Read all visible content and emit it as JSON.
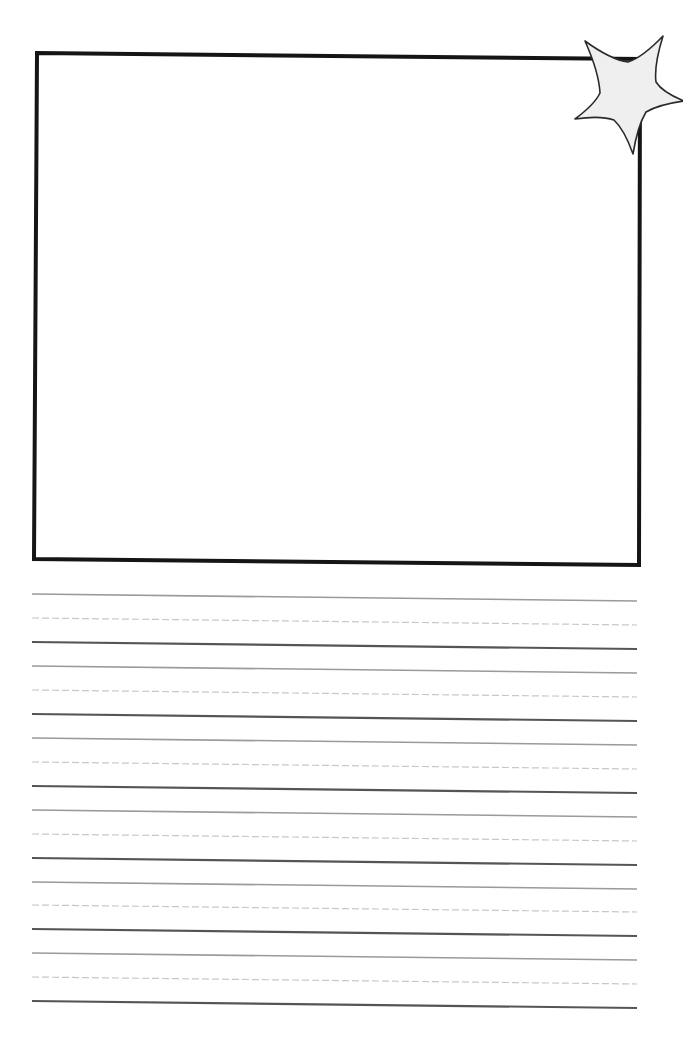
{
  "worksheet": {
    "type": "handwriting-practice-page",
    "drawing_box": {
      "corners": [
        [
          37,
          53
        ],
        [
          640,
          59
        ],
        [
          639,
          565
        ],
        [
          34,
          559
        ]
      ],
      "stroke": "#151515",
      "stroke_width": 4,
      "fill": "#ffffff"
    },
    "star_ornament": {
      "icon": "star-icon",
      "fill": "#efefef",
      "stroke": "#2a2a2a",
      "points": [
        [
          585,
          41
        ],
        [
          628,
          62
        ],
        [
          663,
          36
        ],
        [
          656,
          82
        ],
        [
          684,
          101
        ],
        [
          646,
          112
        ],
        [
          633,
          154
        ],
        [
          614,
          120
        ],
        [
          575,
          119
        ],
        [
          600,
          93
        ]
      ]
    },
    "writing_lines": {
      "x_start": 32,
      "x_end": 637,
      "tilt": 7,
      "top_color": "#9a9a9a",
      "mid_color": "#c8c8c8",
      "base_color": "#555555",
      "groups": [
        {
          "top": 594,
          "mid": 618,
          "base": 642
        },
        {
          "top": 666,
          "mid": 690,
          "base": 714
        },
        {
          "top": 738,
          "mid": 762,
          "base": 786
        },
        {
          "top": 810,
          "mid": 834,
          "base": 858
        },
        {
          "top": 882,
          "mid": 905,
          "base": 929
        },
        {
          "top": 953,
          "mid": 977,
          "base": 1001
        }
      ]
    }
  }
}
